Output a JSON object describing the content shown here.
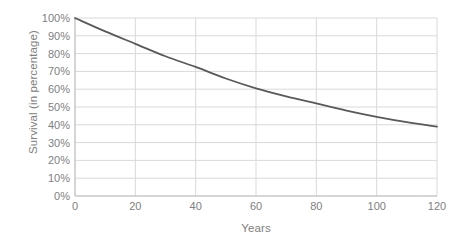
{
  "chart_data": {
    "type": "line",
    "title": "",
    "xlabel": "Years",
    "ylabel": "Survival (in percentage)",
    "xlim": [
      0,
      120
    ],
    "ylim": [
      0,
      100
    ],
    "grid": true,
    "legend": false,
    "x_ticks": [
      "0",
      "20",
      "40",
      "60",
      "80",
      "100",
      "120"
    ],
    "y_ticks": [
      "0%",
      "10%",
      "20%",
      "30%",
      "40%",
      "50%",
      "60%",
      "70%",
      "80%",
      "90%",
      "100%"
    ],
    "x": [
      0,
      10,
      20,
      30,
      40,
      50,
      60,
      70,
      80,
      90,
      100,
      110,
      120
    ],
    "values": [
      100,
      92.5,
      85.5,
      78.5,
      72.5,
      66,
      60.5,
      56,
      52,
      48,
      44.5,
      41.5,
      39
    ],
    "series": [
      {
        "name": "Survival",
        "color": "#595959",
        "x": [
          0,
          10,
          20,
          30,
          40,
          50,
          60,
          70,
          80,
          90,
          100,
          110,
          120
        ],
        "values": [
          100,
          92.5,
          85.5,
          78.5,
          72.5,
          66,
          60.5,
          56,
          52,
          48,
          44.5,
          41.5,
          39
        ]
      }
    ],
    "colors": {
      "line": "#595959",
      "grid": "#d9d9d9",
      "axis": "#bfbfbf",
      "text": "#808080",
      "background": "#ffffff"
    }
  }
}
